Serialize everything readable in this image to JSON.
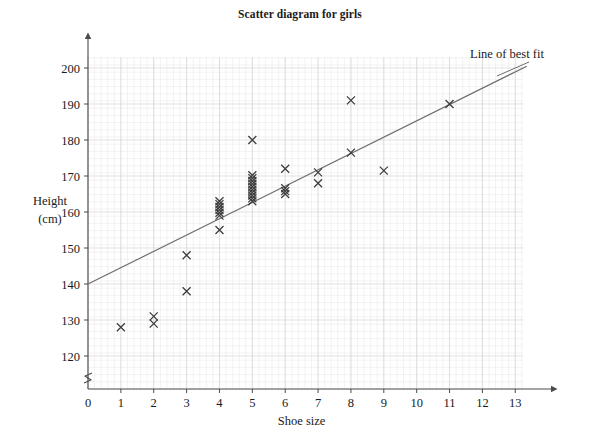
{
  "chart_data": {
    "type": "scatter",
    "title": "Scatter diagram for girls",
    "xlabel": "Shoe size",
    "ylabel_line1": "Height",
    "ylabel_line2": "(cm)",
    "xlim": [
      0,
      13.6
    ],
    "ylim": [
      115,
      203
    ],
    "xticks": [
      "0",
      "1",
      "2",
      "3",
      "4",
      "5",
      "6",
      "7",
      "8",
      "9",
      "10",
      "11",
      "12",
      "13"
    ],
    "xtick_values": [
      0,
      1,
      2,
      3,
      4,
      5,
      6,
      7,
      8,
      9,
      10,
      11,
      12,
      13
    ],
    "yticks": [
      "120",
      "130",
      "140",
      "150",
      "160",
      "170",
      "180",
      "190",
      "200"
    ],
    "ytick_values": [
      120,
      130,
      140,
      150,
      160,
      170,
      180,
      190,
      200
    ],
    "grid": true,
    "grid_minor_color": "#e8e4e4",
    "grid_major_color": "#d8d3d3",
    "marker": "x-cross",
    "marker_color": "#3b3b3b",
    "axis_color": "#4a4a4a",
    "y_axis_break": true,
    "points": [
      {
        "x": 1,
        "y": 128
      },
      {
        "x": 2,
        "y": 129
      },
      {
        "x": 2,
        "y": 131
      },
      {
        "x": 3,
        "y": 138
      },
      {
        "x": 3,
        "y": 148
      },
      {
        "x": 4,
        "y": 155
      },
      {
        "x": 4,
        "y": 159
      },
      {
        "x": 4,
        "y": 159.8
      },
      {
        "x": 4,
        "y": 160.6
      },
      {
        "x": 4,
        "y": 161.4
      },
      {
        "x": 4,
        "y": 162.2
      },
      {
        "x": 4,
        "y": 163
      },
      {
        "x": 5,
        "y": 163
      },
      {
        "x": 5,
        "y": 163.8
      },
      {
        "x": 5,
        "y": 164.6
      },
      {
        "x": 5,
        "y": 165.4
      },
      {
        "x": 5,
        "y": 166.2
      },
      {
        "x": 5,
        "y": 167
      },
      {
        "x": 5,
        "y": 167.8
      },
      {
        "x": 5,
        "y": 168.6
      },
      {
        "x": 5,
        "y": 169.4
      },
      {
        "x": 5,
        "y": 170.2
      },
      {
        "x": 5,
        "y": 180
      },
      {
        "x": 6,
        "y": 165
      },
      {
        "x": 6,
        "y": 165.8
      },
      {
        "x": 6,
        "y": 166.6
      },
      {
        "x": 6,
        "y": 172
      },
      {
        "x": 7,
        "y": 168
      },
      {
        "x": 7,
        "y": 171
      },
      {
        "x": 8,
        "y": 176.5
      },
      {
        "x": 8,
        "y": 191
      },
      {
        "x": 9,
        "y": 171.5
      },
      {
        "x": 11,
        "y": 190
      }
    ],
    "line_of_best_fit": {
      "label": "Line of best fit",
      "x1": 0,
      "y1": 140,
      "x2": 13.35,
      "y2": 200.5,
      "color": "#6e6e6e"
    }
  }
}
